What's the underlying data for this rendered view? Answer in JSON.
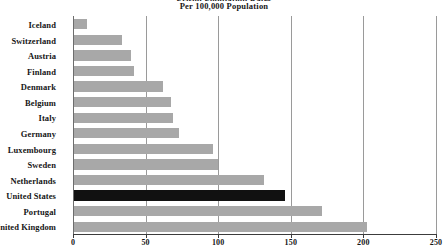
{
  "chart_data": {
    "type": "bar",
    "orientation": "horizontal",
    "title": "Per 100,000 Population",
    "title_clipped_line": "Prison Population Rates",
    "xlabel": "",
    "ylabel": "",
    "xlim": [
      0,
      250
    ],
    "xticks": [
      0,
      50,
      100,
      150,
      200,
      250
    ],
    "xtick_labels": [
      "0",
      "50",
      "100",
      "150",
      "200",
      "250"
    ],
    "grid": "vertical",
    "legend": "none",
    "categories": [
      "Iceland",
      "Switzerland",
      "Austria",
      "Finland",
      "Denmark",
      "Belgium",
      "Italy",
      "Germany",
      "Luxembourg",
      "Sweden",
      "Netherlands",
      "United States",
      "Portugal",
      "United Kingdom"
    ],
    "values": [
      9,
      33,
      39,
      41,
      61,
      67,
      68,
      72,
      96,
      99,
      131,
      145,
      171,
      202
    ],
    "bar_colors": [
      "#a8a8a8",
      "#a8a8a8",
      "#a8a8a8",
      "#a8a8a8",
      "#a8a8a8",
      "#a8a8a8",
      "#a8a8a8",
      "#a8a8a8",
      "#a8a8a8",
      "#a8a8a8",
      "#a8a8a8",
      "#111111",
      "#a8a8a8",
      "#a8a8a8"
    ],
    "highlight_category": "United States",
    "colors": {
      "default_bar": "#a8a8a8",
      "highlight_bar": "#111111",
      "gridline": "#9a9a9a",
      "axis": "#3c3c3c",
      "text": "#161616",
      "background": "#ffffff"
    }
  }
}
